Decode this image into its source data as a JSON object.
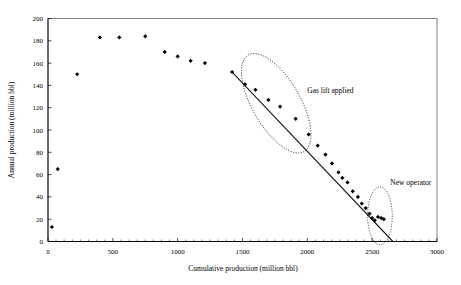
{
  "chart_data": {
    "type": "scatter",
    "title": "",
    "xlabel": "Cumulative production (million bbl)",
    "ylabel": "Annual production (million bbl)",
    "xlim": [
      0,
      3000
    ],
    "ylim": [
      0,
      200
    ],
    "xticks": [
      0,
      500,
      1000,
      1500,
      2000,
      2500,
      3000
    ],
    "yticks": [
      0,
      20,
      40,
      60,
      80,
      100,
      120,
      140,
      160,
      180,
      200
    ],
    "grid": false,
    "legend": null,
    "series": [
      {
        "name": "Annual production",
        "marker": "diamond",
        "color": "#000000",
        "points": [
          [
            30,
            13
          ],
          [
            75,
            65
          ],
          [
            225,
            150
          ],
          [
            400,
            183
          ],
          [
            550,
            183
          ],
          [
            750,
            184
          ],
          [
            900,
            170
          ],
          [
            1000,
            166
          ],
          [
            1100,
            162
          ],
          [
            1210,
            160
          ],
          [
            1420,
            152
          ],
          [
            1520,
            141
          ],
          [
            1600,
            136
          ],
          [
            1700,
            127
          ],
          [
            1790,
            121
          ],
          [
            1910,
            110
          ],
          [
            2010,
            96
          ],
          [
            2080,
            86
          ],
          [
            2140,
            78
          ],
          [
            2190,
            70
          ],
          [
            2240,
            62
          ],
          [
            2270,
            57
          ],
          [
            2310,
            53
          ],
          [
            2350,
            45
          ],
          [
            2390,
            40
          ],
          [
            2420,
            34
          ],
          [
            2450,
            30
          ],
          [
            2480,
            25
          ],
          [
            2500,
            21
          ],
          [
            2520,
            19
          ],
          [
            2545,
            22
          ],
          [
            2570,
            21
          ],
          [
            2590,
            20
          ]
        ]
      }
    ],
    "trendline": {
      "name": "Decline trend",
      "x_start": 1420,
      "y_start": 152,
      "x_end": 2660,
      "y_end": 0
    },
    "annotations": [
      {
        "label": "Gas lift applied",
        "shape": "dotted-ellipse",
        "label_x": 2000,
        "label_y": 133,
        "center_x": 1760,
        "center_y": 124,
        "radius_x": 185,
        "radius_y": 50,
        "rotation_deg": 30
      },
      {
        "label": "New operator",
        "shape": "dotted-circle",
        "label_x": 2640,
        "label_y": 51,
        "center_x": 2560,
        "center_y": 23,
        "radius_x": 95,
        "radius_y": 26,
        "rotation_deg": 0
      }
    ]
  }
}
